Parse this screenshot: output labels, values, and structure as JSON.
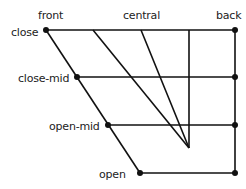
{
  "columns": {
    "front": "front",
    "central": "central",
    "back": "back"
  },
  "rows": {
    "close": "close",
    "close_mid": "close-mid",
    "open_mid": "open-mid",
    "open": "open"
  },
  "colors": {
    "line": "#111111",
    "text": "#222222",
    "background": "#ffffff"
  }
}
